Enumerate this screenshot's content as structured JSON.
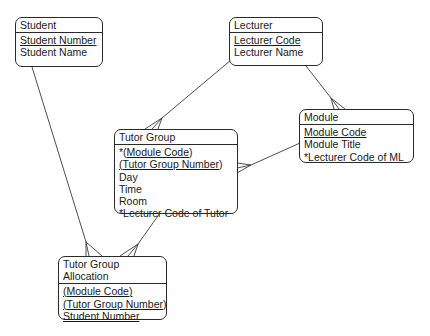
{
  "diagram": {
    "type": "entity-relationship",
    "notation": "crows-foot",
    "entities": [
      {
        "id": "student",
        "title": [
          "Student"
        ],
        "attributes": [
          {
            "text": "Student Number",
            "key": true
          },
          {
            "text": "Student Name",
            "key": false
          }
        ]
      },
      {
        "id": "lecturer",
        "title": [
          "Lecturer"
        ],
        "attributes": [
          {
            "text": "Lecturer Code",
            "key": true
          },
          {
            "text": "Lecturer Name",
            "key": false
          }
        ]
      },
      {
        "id": "module",
        "title": [
          "Module"
        ],
        "attributes": [
          {
            "text": "Module Code",
            "key": true
          },
          {
            "text": "Module Title",
            "key": false
          },
          {
            "text": "*Lecturer Code of ML",
            "key": false
          }
        ]
      },
      {
        "id": "tutor_group",
        "title": [
          "Tutor Group"
        ],
        "attributes": [
          {
            "prefix": "*(",
            "text": "Module Code",
            "suffix": ")",
            "key": true
          },
          {
            "prefix": "(",
            "text": "Tutor Group Number",
            "suffix": ")",
            "key": true
          },
          {
            "text": "Day",
            "key": false
          },
          {
            "text": "Time",
            "key": false
          },
          {
            "text": "Room",
            "key": false
          },
          {
            "text": "*Lecturer Code of Tutor",
            "key": false
          }
        ]
      },
      {
        "id": "tutor_group_allocation",
        "title": [
          "Tutor Group",
          "Allocation"
        ],
        "attributes": [
          {
            "prefix": "(",
            "text": "Module Code",
            "suffix": ")",
            "key": true
          },
          {
            "prefix": "(",
            "text": "Tutor Group Number",
            "suffix": ")",
            "key": true
          },
          {
            "text": "Student Number",
            "key": true
          }
        ]
      }
    ],
    "relationships": [
      {
        "from": "lecturer",
        "to": "tutor_group",
        "cardinality": "one-to-many"
      },
      {
        "from": "lecturer",
        "to": "module",
        "cardinality": "one-to-many"
      },
      {
        "from": "module",
        "to": "tutor_group",
        "cardinality": "one-to-many"
      },
      {
        "from": "student",
        "to": "tutor_group_allocation",
        "cardinality": "one-to-many"
      },
      {
        "from": "tutor_group",
        "to": "tutor_group_allocation",
        "cardinality": "one-to-many"
      }
    ]
  }
}
